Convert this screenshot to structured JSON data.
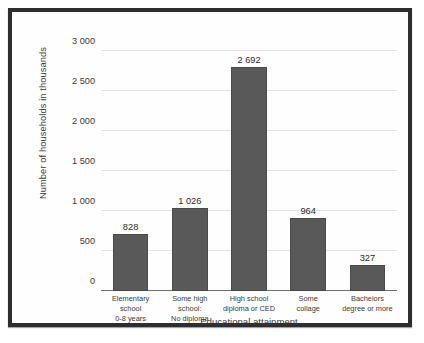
{
  "chart_data": {
    "type": "bar",
    "title": "",
    "xlabel": "Educational attainment",
    "ylabel": "Number of households in thousands",
    "ylim": [
      0,
      3000
    ],
    "ytick_step": 500,
    "grid": true,
    "legend": "none",
    "bar_color": "#595959",
    "categories": [
      "Elementary school 0-8 years",
      "Some high school: No diploma",
      "High school diploma or CED",
      "Some collage",
      "Bachelors degree or more"
    ],
    "category_lines": [
      [
        "Elementary school",
        "0-8 years"
      ],
      [
        "Some high school:",
        "No diploma"
      ],
      [
        "High school",
        "diploma or CED"
      ],
      [
        "Some",
        "collage"
      ],
      [
        "Bachelors",
        "degree or more"
      ]
    ],
    "values": [
      828,
      1026,
      2692,
      964,
      327
    ],
    "value_labels": [
      "828",
      "1 026",
      "2 692",
      "964",
      "327"
    ],
    "plotted_heights": [
      712,
      1032,
      2795,
      918,
      325
    ],
    "ytick_labels": [
      "0",
      "500",
      "1 000",
      "1 500",
      "2 000",
      "2 500",
      "3 000"
    ],
    "ytick_values": [
      0,
      500,
      1000,
      1500,
      2000,
      2500,
      3000
    ]
  }
}
